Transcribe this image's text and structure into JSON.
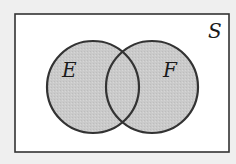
{
  "diagram": {
    "type": "venn",
    "universe": {
      "label": "S",
      "x": 15,
      "y": 14,
      "width": 214,
      "height": 138,
      "fill": "#ffffff",
      "stroke": "#333333"
    },
    "sets": [
      {
        "label": "E",
        "cx": 93,
        "cy": 87,
        "r": 46,
        "label_x": 63,
        "label_y": 77
      },
      {
        "label": "F",
        "cx": 152,
        "cy": 87,
        "r": 46,
        "label_x": 164,
        "label_y": 77
      }
    ],
    "shaded_region": "E ∪ F",
    "colors": {
      "background": "#efefef",
      "set_fill": "#c9c9c9",
      "set_stroke": "#333333"
    }
  }
}
